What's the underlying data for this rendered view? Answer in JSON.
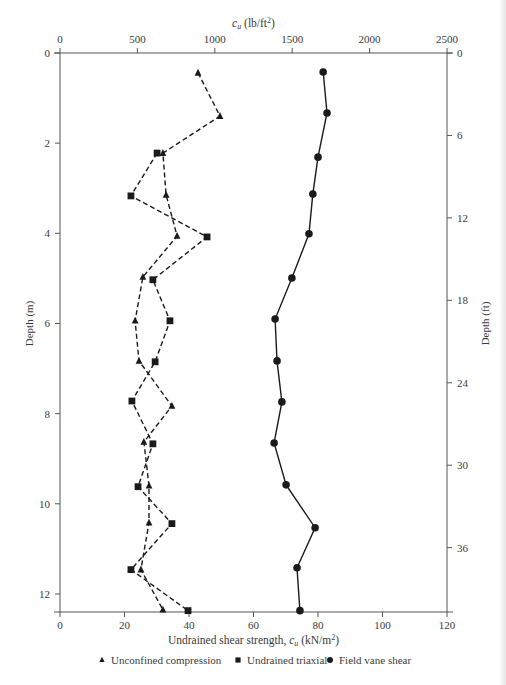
{
  "chart_data": {
    "type": "line",
    "orientation": "depth-profile (x = strength, y = depth, y inverted)",
    "title": "",
    "xlabel": "Undrained shear strength, c_u (kN/m²)",
    "xlabel_parts": {
      "pre": "Undrained shear strength, ",
      "sym": "c",
      "sub": "u",
      "post": " (kN/m",
      "sup": "2",
      "end": ")"
    },
    "x2label": "c_u (lb/ft²)",
    "x2label_parts": {
      "sym": "c",
      "sub": "u",
      "post": " (lb/ft",
      "sup": "2",
      "end": ")"
    },
    "ylabel": "Depth (m)",
    "y2label": "Depth (ft)",
    "xlim": [
      0,
      120
    ],
    "ylim": [
      0,
      12.4
    ],
    "x2lim": [
      0,
      2500
    ],
    "xticks": [
      0,
      20,
      40,
      60,
      80,
      100,
      120
    ],
    "x2ticks": [
      0,
      500,
      1000,
      1500,
      2000,
      2500
    ],
    "yticks": [
      0,
      2,
      4,
      6,
      8,
      10,
      12
    ],
    "y2ticks": [
      0,
      6,
      12,
      18,
      24,
      30,
      36
    ],
    "grid": false,
    "legend_position": "bottom",
    "series": [
      {
        "name": "Unconfined compression",
        "marker": "triangle",
        "line": "dashed",
        "points": [
          [
            42.8,
            0.44
          ],
          [
            49.6,
            1.4
          ],
          [
            31.9,
            2.22
          ],
          [
            32.9,
            3.15
          ],
          [
            36.3,
            4.06
          ],
          [
            25.7,
            4.97
          ],
          [
            23.3,
            5.94
          ],
          [
            24.5,
            6.83
          ],
          [
            34.7,
            7.83
          ],
          [
            26.0,
            8.63
          ],
          [
            27.6,
            9.6
          ],
          [
            27.6,
            10.42
          ],
          [
            25.1,
            11.46
          ],
          [
            31.9,
            12.35
          ]
        ]
      },
      {
        "name": "Undrained triaxial",
        "marker": "square",
        "line": "dashed",
        "points": [
          [
            30.1,
            2.22
          ],
          [
            22.0,
            3.17
          ],
          [
            45.6,
            4.08
          ],
          [
            28.8,
            5.03
          ],
          [
            34.1,
            5.94
          ],
          [
            29.5,
            6.85
          ],
          [
            22.3,
            7.72
          ],
          [
            28.8,
            8.67
          ],
          [
            24.2,
            9.62
          ],
          [
            34.7,
            10.44
          ],
          [
            22.0,
            11.46
          ],
          [
            39.7,
            12.37
          ]
        ]
      },
      {
        "name": "Field vane shear",
        "marker": "circle",
        "line": "solid",
        "points": [
          [
            81.6,
            0.42
          ],
          [
            82.8,
            1.33
          ],
          [
            80.0,
            2.31
          ],
          [
            78.4,
            3.13
          ],
          [
            77.2,
            4.01
          ],
          [
            71.9,
            4.99
          ],
          [
            66.7,
            5.9
          ],
          [
            67.3,
            6.83
          ],
          [
            68.8,
            7.74
          ],
          [
            66.4,
            8.65
          ],
          [
            70.1,
            9.58
          ],
          [
            79.1,
            10.53
          ],
          [
            73.5,
            11.42
          ],
          [
            74.4,
            12.37
          ]
        ]
      }
    ]
  },
  "legend": {
    "items": [
      {
        "symbol": "▲",
        "label": "Unconfined compression"
      },
      {
        "symbol": "■",
        "label": "Undrained triaxial"
      },
      {
        "symbol": "●",
        "label": "Field vane shear"
      }
    ]
  },
  "style": {
    "axis_color": "#555555",
    "series_color": "#1a1a1a",
    "text_color": "#3a3a3a"
  }
}
